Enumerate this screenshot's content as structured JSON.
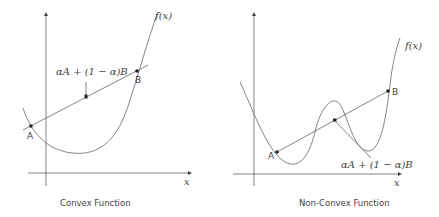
{
  "panels": [
    {
      "title": "Convex Function",
      "function_label": "f(x)",
      "x_axis_label": "x",
      "point_a_label": "A",
      "point_b_label": "B",
      "combination_label": "αA + (1 − α)B"
    },
    {
      "title": "Non-Convex Function",
      "function_label": "f(x)",
      "x_axis_label": "x",
      "point_a_label": "A",
      "point_b_label": "B",
      "combination_label": "αA + (1 − α)B"
    }
  ],
  "colors": {
    "line": "#555555",
    "curve": "#777777",
    "text": "#444444",
    "point": "#222222"
  }
}
